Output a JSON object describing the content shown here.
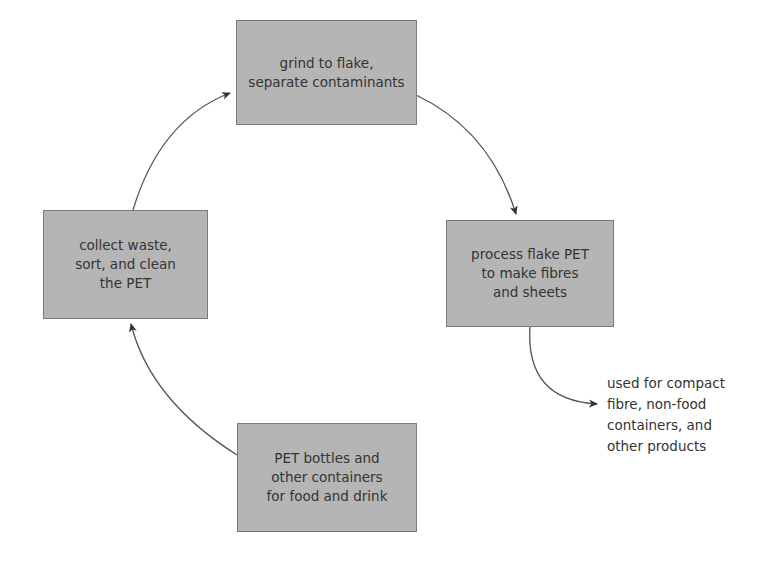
{
  "diagram": {
    "type": "cycle",
    "nodes": [
      {
        "id": "grind",
        "label": "grind to flake,\nseparate contaminants"
      },
      {
        "id": "process",
        "label": "process flake PET\nto make fibres\nand sheets"
      },
      {
        "id": "bottles",
        "label": "PET bottles and\nother containers\nfor food and drink"
      },
      {
        "id": "collect",
        "label": "collect waste,\nsort, and clean\nthe PET"
      }
    ],
    "output_note": "used for compact\nfibre, non-food\ncontainers, and\nother products",
    "edges": [
      {
        "from": "collect",
        "to": "grind"
      },
      {
        "from": "grind",
        "to": "process"
      },
      {
        "from": "process",
        "to": "output_note"
      },
      {
        "from": "bottles",
        "to": "collect"
      }
    ],
    "colors": {
      "box_fill": "#b5b5b5",
      "box_border": "#7a7a7a",
      "text": "#333333",
      "arrow": "#444444"
    }
  }
}
